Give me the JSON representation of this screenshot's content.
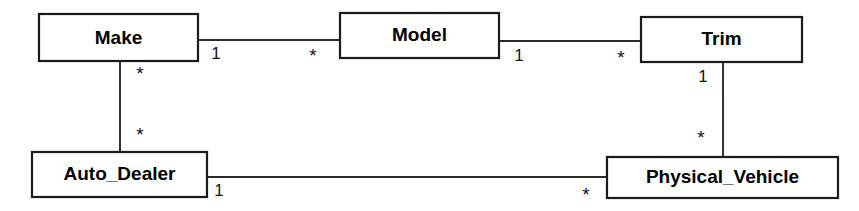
{
  "diagram": {
    "type": "uml-class-association-diagram",
    "title": "",
    "background_color": "#ffffff",
    "line_color": "#2a2a2a",
    "box_fill": "#ffffff",
    "box_border_color": "#1a1a1a",
    "text_color": "#000000",
    "entities": [
      {
        "id": "make",
        "label": "Make",
        "x": 39,
        "y": 14,
        "width": 159,
        "height": 47
      },
      {
        "id": "model",
        "label": "Model",
        "x": 340,
        "y": 13,
        "width": 159,
        "height": 45
      },
      {
        "id": "trim",
        "label": "Trim",
        "x": 641,
        "y": 17,
        "width": 161,
        "height": 45
      },
      {
        "id": "auto_dealer",
        "label": "Auto_Dealer",
        "x": 32,
        "y": 152,
        "width": 175,
        "height": 45
      },
      {
        "id": "physical_vehicle",
        "label": "Physical_Vehicle",
        "x": 607,
        "y": 157,
        "width": 231,
        "height": 41
      }
    ],
    "associations": [
      {
        "id": "make-model",
        "from": "make",
        "to": "model",
        "orientation": "horizontal",
        "from_multiplicity": "1",
        "to_multiplicity": "*"
      },
      {
        "id": "model-trim",
        "from": "model",
        "to": "trim",
        "orientation": "horizontal",
        "from_multiplicity": "1",
        "to_multiplicity": "*"
      },
      {
        "id": "make-auto_dealer",
        "from": "make",
        "to": "auto_dealer",
        "orientation": "vertical",
        "from_multiplicity": "*",
        "to_multiplicity": "*"
      },
      {
        "id": "trim-physical_vehicle",
        "from": "trim",
        "to": "physical_vehicle",
        "orientation": "vertical",
        "from_multiplicity": "1",
        "to_multiplicity": "*"
      },
      {
        "id": "auto_dealer-physical_vehicle",
        "from": "auto_dealer",
        "to": "physical_vehicle",
        "orientation": "horizontal",
        "from_multiplicity": "1",
        "to_multiplicity": "*"
      }
    ]
  }
}
